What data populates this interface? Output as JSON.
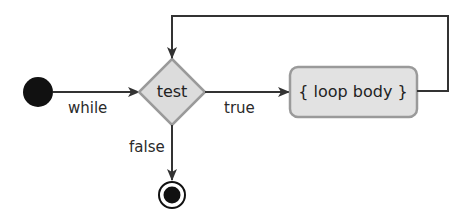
{
  "diagram": {
    "type": "activity-diagram",
    "colors": {
      "line": "#333333",
      "node_fill": "#dcdcdc",
      "node_stroke": "#9a9a9a",
      "start": "#111111"
    },
    "nodes": {
      "start": {
        "kind": "initial-node"
      },
      "test": {
        "kind": "decision",
        "label": "test"
      },
      "body": {
        "kind": "action",
        "label": "{ loop body }"
      },
      "end": {
        "kind": "final-node"
      }
    },
    "edges": {
      "start_to_test": {
        "label": "while"
      },
      "test_to_body": {
        "label": "true"
      },
      "test_to_end": {
        "label": "false"
      },
      "body_to_test": {
        "label": ""
      }
    }
  }
}
